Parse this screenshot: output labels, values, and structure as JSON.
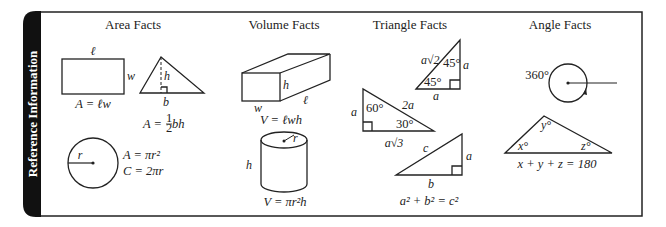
{
  "panel": {
    "tab_label": "Reference Information",
    "colors": {
      "tab": "#111111",
      "border": "#222222",
      "background": "#ffffff",
      "ink": "#222222"
    }
  },
  "sections": {
    "area": {
      "heading": "Area Facts",
      "rectangle": {
        "length_label": "ℓ",
        "width_label": "w",
        "formula": "A = ℓw"
      },
      "triangle": {
        "height_label": "h",
        "base_label": "b",
        "formula_prefix": "A = ",
        "fraction_num": "1",
        "fraction_den": "2",
        "formula_suffix": " bh"
      },
      "circle": {
        "radius_label": "r",
        "area_formula": "A = πr²",
        "circumference_formula": "C = 2πr"
      }
    },
    "volume": {
      "heading": "Volume Facts",
      "prism": {
        "height_label": "h",
        "width_label": "w",
        "length_label": "ℓ",
        "formula": "V = ℓwh"
      },
      "cylinder": {
        "radius_label": "r",
        "height_label": "h",
        "formula": "V = πr²h"
      }
    },
    "triangle": {
      "heading": "Triangle Facts",
      "right_45": {
        "hyp_label": "a√2",
        "angle_top": "45°",
        "angle_bottom": "45°",
        "leg_vertical": "a",
        "leg_horizontal": "a"
      },
      "right_30_60": {
        "short_leg": "a",
        "angle_60": "60°",
        "hyp_label": "2a",
        "angle_30": "30°",
        "long_leg": "a√3"
      },
      "pythagorean": {
        "hyp_label": "c",
        "leg_vertical": "a",
        "leg_horizontal": "b",
        "formula": "a² + b² = c²"
      }
    },
    "angle": {
      "heading": "Angle Facts",
      "circle": {
        "label": "360°"
      },
      "triangle": {
        "angle_x": "x°",
        "angle_y": "y°",
        "angle_z": "z°",
        "formula": "x + y + z = 180"
      }
    }
  }
}
